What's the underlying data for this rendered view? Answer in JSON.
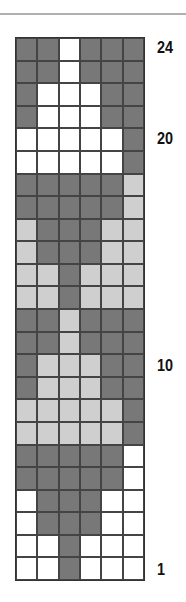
{
  "chart": {
    "columns": 6,
    "rows": 24,
    "colors": {
      "D": "#787878",
      "L": "#cfcfcf",
      "W": "#ffffff"
    },
    "grid_top_to_bottom": [
      "DDWDDD",
      "DDWDDD",
      "DWWWDD",
      "DWWWDD",
      "WWWWWD",
      "WWWWWD",
      "DDDDDL",
      "DDDDDL",
      "LDDDLL",
      "LDDDLL",
      "LLDLLL",
      "LLDLLL",
      "DDLDDD",
      "DDLDDD",
      "DLLLDD",
      "DLLLDD",
      "LLLLLD",
      "LLLLLD",
      "DDDDDW",
      "DDDDDW",
      "WDDDWW",
      "WDDDWW",
      "WWDWWW",
      "WWDWWW"
    ],
    "row_labels": [
      {
        "row": 24,
        "text": "24"
      },
      {
        "row": 20,
        "text": "20"
      },
      {
        "row": 10,
        "text": "10"
      },
      {
        "row": 1,
        "text": "1"
      }
    ]
  }
}
